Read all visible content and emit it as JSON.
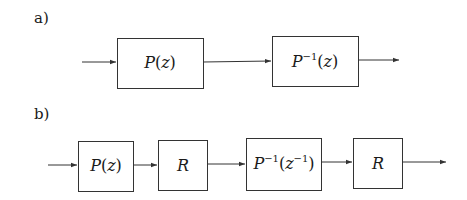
{
  "diagrams": [
    {
      "id": "a",
      "label": "a)",
      "blocks": [
        {
          "name": "P",
          "text": "P(z)",
          "base": "P",
          "sup": "",
          "arg": "z",
          "argSup": ""
        },
        {
          "name": "P-inverse",
          "text": "P^{-1}(z)",
          "base": "P",
          "sup": "−1",
          "arg": "z",
          "argSup": ""
        }
      ]
    },
    {
      "id": "b",
      "label": "b)",
      "blocks": [
        {
          "name": "P",
          "text": "P(z)",
          "base": "P",
          "sup": "",
          "arg": "z",
          "argSup": ""
        },
        {
          "name": "R",
          "text": "R"
        },
        {
          "name": "P-inverse-zinv",
          "text": "P^{-1}(z^{-1})",
          "base": "P",
          "sup": "−1",
          "arg": "z",
          "argSup": "−1"
        },
        {
          "name": "R",
          "text": "R"
        }
      ]
    }
  ],
  "colors": {
    "stroke": "#333333",
    "text": "#1a1a1a",
    "background": "#ffffff"
  }
}
